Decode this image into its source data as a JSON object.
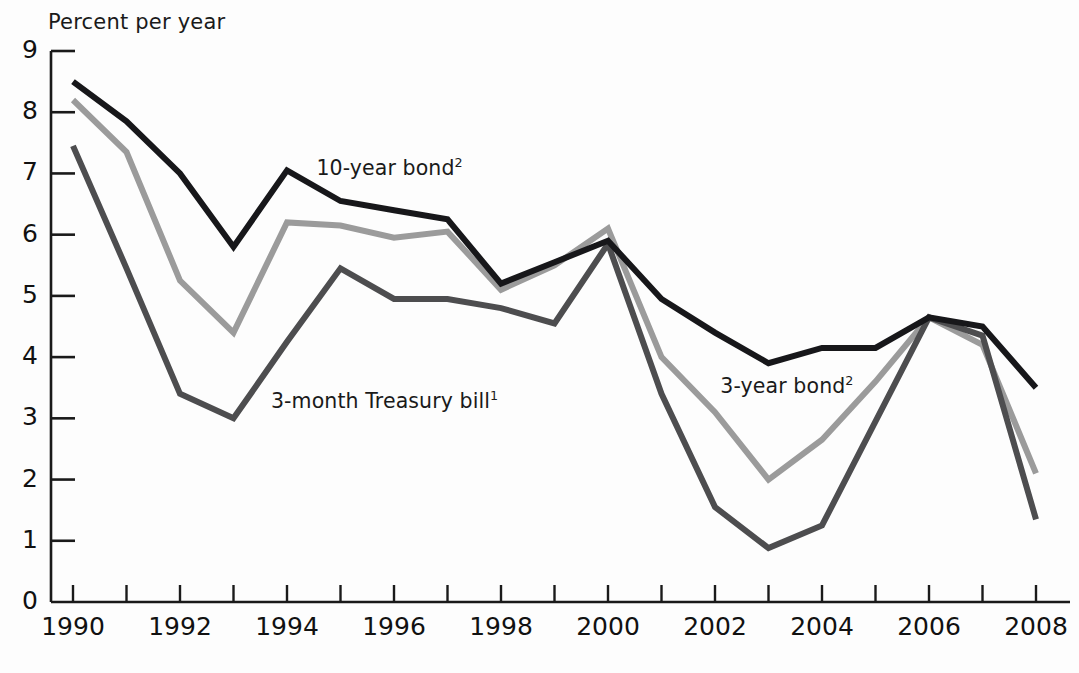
{
  "chart_data": {
    "type": "line",
    "title": "",
    "ylabel": "Percent per year",
    "xlabel": "",
    "xlim": [
      1990,
      2008
    ],
    "ylim": [
      0,
      9
    ],
    "grid": false,
    "legend_position": "inline-annotations",
    "x": [
      1990,
      1991,
      1992,
      1993,
      1994,
      1995,
      1996,
      1997,
      1998,
      1999,
      2000,
      2001,
      2002,
      2003,
      2004,
      2005,
      2006,
      2007,
      2008
    ],
    "ytick_labels": [
      "0",
      "1",
      "2",
      "3",
      "4",
      "5",
      "6",
      "7",
      "8",
      "9"
    ],
    "xtick_labels": [
      "1990",
      "1992",
      "1994",
      "1996",
      "1998",
      "2000",
      "2002",
      "2004",
      "2006",
      "2008"
    ],
    "xtick_values": [
      1990,
      1992,
      1994,
      1996,
      1998,
      2000,
      2002,
      2004,
      2006,
      2008
    ],
    "series": [
      {
        "name": "10-year bond",
        "footnote": "2",
        "color": "#17171a",
        "width": 6,
        "label_x": 1994.55,
        "label_y": 7.05,
        "values": [
          8.5,
          7.85,
          7.0,
          5.8,
          7.05,
          6.55,
          6.4,
          6.25,
          5.2,
          5.55,
          5.9,
          4.95,
          4.4,
          3.9,
          4.15,
          4.15,
          4.65,
          4.5,
          3.5
        ]
      },
      {
        "name": "3-year bond",
        "footnote": "2",
        "color": "#9b9b9b",
        "width": 6,
        "label_x": 2002.1,
        "label_y": 3.5,
        "values": [
          8.2,
          7.35,
          5.25,
          4.4,
          6.2,
          6.15,
          5.95,
          6.05,
          5.1,
          5.5,
          6.1,
          4.0,
          3.1,
          2.0,
          2.65,
          3.6,
          4.65,
          4.2,
          2.1
        ]
      },
      {
        "name": "3-month Treasury bill",
        "footnote": "1",
        "color": "#4d4d4f",
        "width": 6,
        "label_x": 1993.7,
        "label_y": 3.25,
        "values": [
          7.45,
          5.45,
          3.4,
          3.0,
          4.25,
          5.45,
          4.95,
          4.95,
          4.8,
          4.55,
          5.85,
          3.4,
          1.55,
          0.88,
          1.25,
          2.95,
          4.65,
          4.35,
          1.35
        ]
      }
    ]
  }
}
